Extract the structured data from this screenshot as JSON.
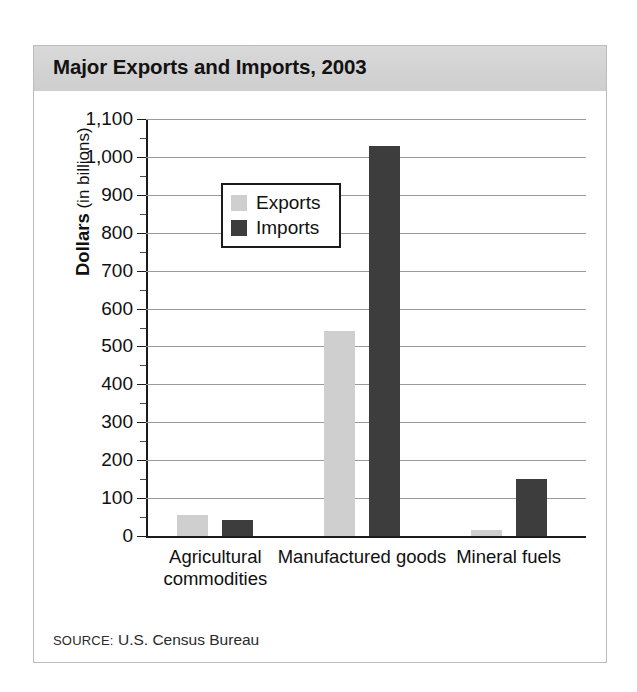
{
  "card": {
    "title": "Major Exports and Imports, 2003",
    "source_prefix": "SOURCE:",
    "source_text": " U.S. Census Bureau"
  },
  "axis": {
    "y_title_strong": "Dollars",
    "y_title_rest": " (in billions)"
  },
  "legend": {
    "items": [
      {
        "label": "Exports",
        "color": "#cfcfcf"
      },
      {
        "label": "Imports",
        "color": "#3d3d3d"
      }
    ]
  },
  "chart_data": {
    "type": "bar",
    "title": "Major Exports and Imports, 2003",
    "xlabel": "",
    "ylabel": "Dollars (in billions)",
    "ylim": [
      0,
      1100
    ],
    "ytick_labels": [
      "1,100",
      "1,000",
      "900",
      "800",
      "700",
      "600",
      "500",
      "400",
      "300",
      "200",
      "100",
      "0"
    ],
    "ytick_values": [
      1100,
      1000,
      900,
      800,
      700,
      600,
      500,
      400,
      300,
      200,
      100,
      0
    ],
    "minor_tick_step": 50,
    "grid": true,
    "legend_position": "upper-left-inside",
    "categories": [
      "Agricultural commodities",
      "Manufactured goods",
      "Mineral fuels"
    ],
    "series": [
      {
        "name": "Exports",
        "color": "#cfcfcf",
        "values": [
          55,
          542,
          15
        ]
      },
      {
        "name": "Imports",
        "color": "#3d3d3d",
        "values": [
          43,
          1030,
          150
        ]
      }
    ],
    "source": "SOURCE: U.S. Census Bureau"
  }
}
